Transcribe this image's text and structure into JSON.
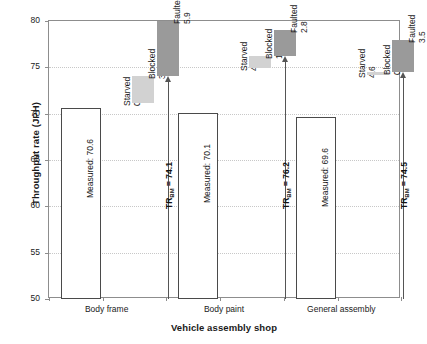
{
  "chart_data": {
    "type": "bar",
    "title": "",
    "xlabel": "Vehicle assembly shop",
    "ylabel": "Throughput rate (JPH)",
    "ylim": [
      50,
      80
    ],
    "yticks": [
      50,
      55,
      60,
      65,
      70,
      75,
      80
    ],
    "grid": true,
    "legend": "none",
    "categories": [
      "Body frame",
      "Body paint",
      "General assembly"
    ],
    "values": [
      70.6,
      70.1,
      69.6
    ],
    "measured_labels": [
      "Measured: 70.6",
      "Measured: 70.1",
      "Measured: 69.6"
    ],
    "benchmark_values": [
      74.1,
      76.2,
      74.5
    ],
    "benchmark_labels": [
      "TR",
      "TR",
      "TR"
    ],
    "benchmark_subscript": "BM",
    "benchmark_value_labels": [
      "= 74.1",
      "= 76.2",
      "= 74.5"
    ],
    "loss_series": [
      {
        "name": "Starved",
        "values": [
          0.5,
          4.8,
          4.6
        ]
      },
      {
        "name": "Blocked",
        "values": [
          3.0,
          1.3,
          0.3
        ]
      },
      {
        "name": "Faulted",
        "values": [
          5.9,
          2.8,
          3.5
        ]
      }
    ],
    "groups": [
      {
        "category": "Body frame",
        "measured": 70.6,
        "measured_label": "Measured: 70.6",
        "benchmark": 74.1,
        "benchmark_label": "TR",
        "benchmark_sub": "BM",
        "benchmark_eq": "= 74.1",
        "losses": [
          {
            "name": "Starved",
            "value": "0.5",
            "shade": "plain"
          },
          {
            "name": "Blocked",
            "value": "3.0",
            "shade": "light"
          },
          {
            "name": "Faulted",
            "value": "5.9",
            "shade": "dark"
          }
        ]
      },
      {
        "category": "Body paint",
        "measured": 70.1,
        "measured_label": "Measured: 70.1",
        "benchmark": 76.2,
        "benchmark_label": "TR",
        "benchmark_sub": "BM",
        "benchmark_eq": "= 76.2",
        "losses": [
          {
            "name": "Starved",
            "value": "4.8",
            "shade": "plain"
          },
          {
            "name": "Blocked",
            "value": "1.3",
            "shade": "light"
          },
          {
            "name": "Faulted",
            "value": "2.8",
            "shade": "dark"
          }
        ]
      },
      {
        "category": "General assembly",
        "measured": 69.6,
        "measured_label": "Measured: 69.6",
        "benchmark": 74.5,
        "benchmark_label": "TR",
        "benchmark_sub": "BM",
        "benchmark_eq": "= 74.5",
        "losses": [
          {
            "name": "Starved",
            "value": "4.6",
            "shade": "plain"
          },
          {
            "name": "Blocked",
            "value": "0.3",
            "shade": "light"
          },
          {
            "name": "Faulted",
            "value": "3.5",
            "shade": "dark"
          }
        ]
      }
    ],
    "colors": {
      "bar_fill": "#ffffff",
      "bar_stroke": "#4a4a4a",
      "block_light": "#d2d2d2",
      "block_dark": "#9a9a9a",
      "grid": "#c8c8c8",
      "axis": "#8d8d8d",
      "text": "#1a1a1a"
    }
  }
}
